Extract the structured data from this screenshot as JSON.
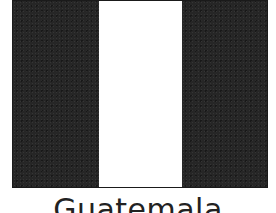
{
  "flag": {
    "country": "Guatemala",
    "bands": [
      {
        "position": "left",
        "color": "#262626"
      },
      {
        "position": "center",
        "color": "#ffffff"
      },
      {
        "position": "right",
        "color": "#262626"
      }
    ]
  },
  "caption": "Guatemala"
}
